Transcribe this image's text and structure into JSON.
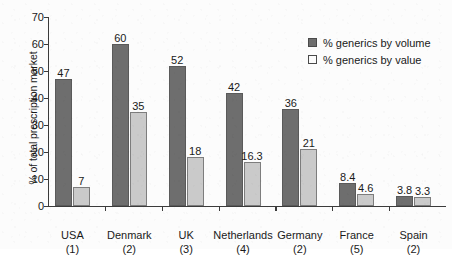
{
  "chart_data": {
    "type": "bar",
    "title": "",
    "xlabel": "",
    "ylabel": "% of total prescription market",
    "ylim": [
      0,
      70
    ],
    "yticks": [
      0,
      10,
      20,
      30,
      40,
      50,
      60,
      70
    ],
    "grid": false,
    "legend_position": "top-right",
    "categories": [
      "USA",
      "Denmark",
      "UK",
      "Netherlands",
      "Germany",
      "France",
      "Spain"
    ],
    "category_refs": [
      "(1)",
      "(2)",
      "(3)",
      "(4)",
      "(2)",
      "(5)",
      "(2)"
    ],
    "series": [
      {
        "name": "% generics by volume",
        "color": "#6e6e6e",
        "values": [
          47,
          60,
          52,
          42,
          36,
          8.4,
          3.8
        ],
        "labels": [
          "47",
          "60",
          "52",
          "42",
          "36",
          "8.4",
          "3.8"
        ]
      },
      {
        "name": "% generics by value",
        "color": "#cacaca",
        "values": [
          7,
          35,
          18,
          16.3,
          21,
          4.6,
          3.3
        ],
        "labels": [
          "7",
          "35",
          "18",
          "16.3",
          "21",
          "4.6",
          "3.3"
        ]
      }
    ]
  }
}
